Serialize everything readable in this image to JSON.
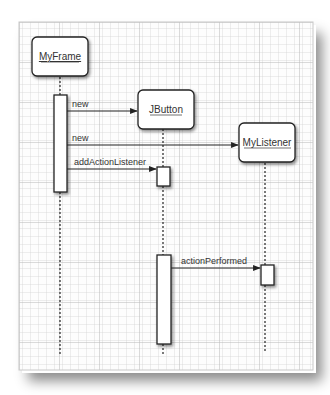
{
  "diagram": {
    "type": "sequence",
    "participants": [
      {
        "id": "myframe",
        "label": "MyFrame"
      },
      {
        "id": "jbutton",
        "label": "JButton"
      },
      {
        "id": "mylistener",
        "label": "MyListener"
      }
    ],
    "messages": [
      {
        "from": "MyFrame",
        "to": "JButton",
        "label": "new"
      },
      {
        "from": "MyFrame",
        "to": "MyListener",
        "label": "new"
      },
      {
        "from": "MyFrame",
        "to": "JButton",
        "label": "addActionListener"
      },
      {
        "from": "JButton",
        "to": "MyListener",
        "label": "actionPerformed"
      }
    ]
  },
  "colors": {
    "paper": "#fdfdfd",
    "grid_minor": "#d9d9d9",
    "grid_major": "#bdbdbd",
    "stroke": "#2a2a2a",
    "box_fill": "#ffffff",
    "text": "#333333"
  }
}
